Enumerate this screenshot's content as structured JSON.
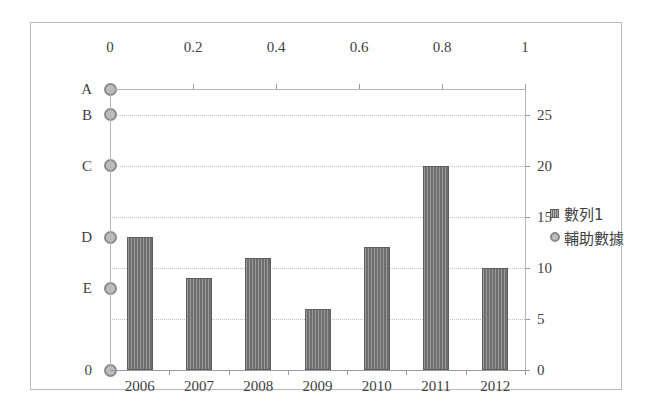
{
  "chart_data": {
    "type": "bar",
    "title": "",
    "subtitle": "",
    "xlabel": "",
    "ylabel": "",
    "grid": true,
    "legend_position": "right",
    "categories": [
      "2006",
      "2007",
      "2008",
      "2009",
      "2010",
      "2011",
      "2012"
    ],
    "series": [
      {
        "name": "數列1",
        "type": "bar",
        "axis": "right",
        "values": [
          13,
          9,
          11,
          6,
          12,
          20,
          10
        ]
      },
      {
        "name": "輔助數據",
        "type": "scatter",
        "axis": "left",
        "x": [
          0,
          0,
          0,
          0,
          0,
          0
        ],
        "point_labels": [
          "A",
          "B",
          "C",
          "D",
          "E",
          "0"
        ],
        "values": [
          27.5,
          25,
          20,
          13,
          8,
          0
        ]
      }
    ],
    "axes": {
      "primary_y_right": {
        "ticks": [
          "0",
          "5",
          "10",
          "15",
          "20",
          "25"
        ],
        "values": [
          0,
          5,
          10,
          15,
          20,
          25
        ],
        "ylim": [
          0,
          27.5
        ]
      },
      "secondary_x_top": {
        "ticks": [
          "0",
          "0.2",
          "0.4",
          "0.6",
          "0.8",
          "1"
        ],
        "values": [
          0,
          0.2,
          0.4,
          0.6,
          0.8,
          1
        ],
        "xlim": [
          0,
          1
        ]
      },
      "secondary_y_left": {
        "ticks": [
          "A",
          "B",
          "C",
          "D",
          "E",
          "0"
        ]
      },
      "primary_x_bottom": {
        "ticks": [
          "2006",
          "2007",
          "2008",
          "2009",
          "2010",
          "2011",
          "2012"
        ]
      }
    },
    "colors": {
      "bar_fill": "#6e6e6e",
      "bar_border": "#5e5e5e",
      "marker_fill": "#bdbdbd",
      "marker_border": "#8a8a8a",
      "gridline": "#c2c2c2",
      "axis_line": "#9a9a9a",
      "frame_border": "#b9b9b9",
      "background": "#ffffff",
      "text": "#3f3f3f"
    }
  },
  "legend": {
    "items": [
      {
        "label": "數列1",
        "marker": "bar-swatch-icon"
      },
      {
        "label": "輔助數據",
        "marker": "circle-marker-icon"
      }
    ]
  }
}
